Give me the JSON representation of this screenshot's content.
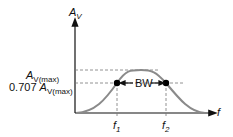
{
  "diagram": {
    "y_axis_label": "A",
    "y_axis_sub": "V",
    "x_axis_label": "f",
    "amax_label": "A",
    "amax_sub": "V(max)",
    "a707_prefix": "0.707 ",
    "a707_label": "A",
    "a707_sub": "V(max)",
    "bw_label": "BW",
    "f1_label": "f",
    "f1_sub": "1",
    "f2_label": "f",
    "f2_sub": "2",
    "colors": {
      "axis": "#111111",
      "curve": "#8a8a8a",
      "dash": "#777777",
      "dot": "#000000"
    }
  }
}
